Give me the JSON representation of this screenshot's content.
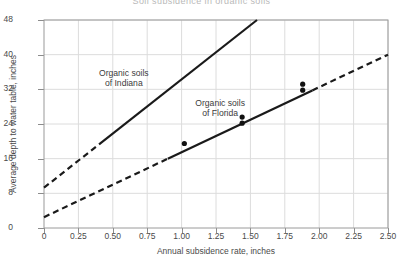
{
  "chart_data": {
    "type": "line",
    "title": "Soil subsidence in organic soils",
    "xlabel": "Annual subsidence rate, inches",
    "ylabel": "Average depth to water table, inches",
    "xlim": [
      0,
      2.5
    ],
    "ylim": [
      0,
      48
    ],
    "xticks": [
      "0",
      "0.25",
      "0.50",
      "0.75",
      "1.00",
      "1.25",
      "1.50",
      "1.75",
      "2.00",
      "2.25",
      "2.50"
    ],
    "xtick_values": [
      0,
      0.25,
      0.5,
      0.75,
      1.0,
      1.25,
      1.5,
      1.75,
      2.0,
      2.25,
      2.5
    ],
    "yticks": [
      "0",
      "8",
      "16",
      "24",
      "32",
      "40",
      "48"
    ],
    "ytick_values": [
      0,
      8,
      16,
      24,
      32,
      40,
      48
    ],
    "grid": true,
    "legend_position": "inline-annotations",
    "series": [
      {
        "name": "Organic soils of Indiana",
        "annotation_lines": [
          "Organic soils",
          "of Indiana"
        ],
        "annotation_x": 0.58,
        "annotation_y": 35.0,
        "color": "#1a1a1a",
        "fit_intercept": 9.3,
        "fit_slope": 25.0,
        "solid_from_x": 0.4,
        "solid_to_x": 1.55,
        "dashed_from_x": 0.0,
        "dashed_to_x": 0.4,
        "x_start": 0.0,
        "x_end": 1.55,
        "y_start": 9.3,
        "y_end": 48.0,
        "points": []
      },
      {
        "name": "Organic soils of Florida",
        "annotation_lines": [
          "Organic soils",
          "of Florida"
        ],
        "annotation_x": 1.28,
        "annotation_y": 28.2,
        "color": "#1a1a1a",
        "fit_intercept": 2.5,
        "fit_slope": 15.0,
        "solid_from_x": 0.9,
        "solid_to_x": 1.95,
        "dashed_segments": [
          [
            0.0,
            0.9
          ],
          [
            1.95,
            2.5
          ]
        ],
        "x_start": 0.0,
        "x_end": 2.5,
        "y_start": 2.5,
        "y_end": 40.0,
        "points": [
          {
            "x": 1.02,
            "y": 19.5
          },
          {
            "x": 1.44,
            "y": 25.6
          },
          {
            "x": 1.44,
            "y": 24.2
          },
          {
            "x": 1.88,
            "y": 33.2
          },
          {
            "x": 1.88,
            "y": 31.8
          }
        ]
      }
    ]
  }
}
